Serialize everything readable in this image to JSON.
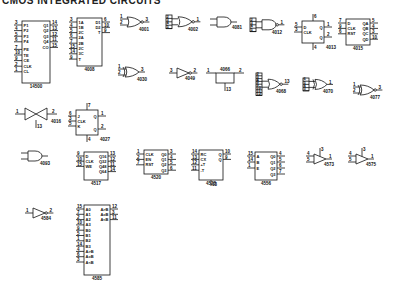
{
  "title": "CMOS INTEGRATED CIRCUITS",
  "parts": {
    "p14500": {
      "name": "14500",
      "left_pins": [
        {
          "n": "3",
          "l": "P1"
        },
        {
          "n": "4",
          "l": "P2"
        },
        {
          "n": "5",
          "l": "P3"
        },
        {
          "n": "6",
          "l": "P4"
        },
        {
          "n": "7",
          "l": "PE"
        },
        {
          "n": "10",
          "l": "TE"
        },
        {
          "n": "9",
          "l": "CE"
        },
        {
          "n": "2",
          "l": "CLK"
        },
        {
          "n": "1",
          "l": "CL"
        }
      ],
      "right_pins": [
        {
          "n": "14",
          "l": "Q1"
        },
        {
          "n": "13",
          "l": "Q2"
        },
        {
          "n": "12",
          "l": "Q3"
        },
        {
          "n": "11",
          "l": "Q4"
        },
        {
          "n": "15",
          "l": "CO"
        }
      ]
    },
    "p4008": {
      "name": "4008",
      "left_pins": [
        {
          "n": "3",
          "l": "1A"
        },
        {
          "n": "4",
          "l": "1B"
        },
        {
          "n": "5",
          "l": "2C"
        },
        {
          "n": "6",
          "l": "2A"
        },
        {
          "n": "7",
          "l": "2B"
        },
        {
          "n": "15",
          "l": "2C"
        },
        {
          "n": "14",
          "l": "3C"
        },
        {
          "n": "9",
          "l": "T"
        }
      ],
      "right_pins": [
        {
          "n": "6",
          "l": "D1"
        },
        {
          "n": "10",
          "l": "D2"
        },
        {
          "n": "9",
          "l": "T"
        }
      ]
    },
    "p4001": {
      "name": "4001",
      "in": [
        "1",
        "2"
      ],
      "out": "3"
    },
    "p4002": {
      "name": "4002",
      "in": [
        "2",
        "3",
        "4",
        "5"
      ],
      "out": "1"
    },
    "p4081": {
      "name": "4081"
    },
    "p4012": {
      "name": "4012",
      "in": [
        "2",
        "3",
        "4",
        "5"
      ],
      "out": "1"
    },
    "p4013": {
      "name": "4013",
      "pins": {
        "top": "6",
        "d": "5",
        "clk": "3",
        "q": "1",
        "qn": "2",
        "bottom": "4",
        "r": "R",
        "s": "S"
      },
      "labels": {
        "d": "D",
        "clk": "CLK",
        "q": "Q",
        "qn": "Q"
      }
    },
    "p4015": {
      "name": "4015",
      "left_pins": [
        {
          "n": "7",
          "l": "D"
        },
        {
          "n": "9",
          "l": "CLK"
        },
        {
          "n": "6",
          "l": "RST"
        }
      ],
      "right_pins": [
        {
          "n": "5",
          "l": "QA"
        },
        {
          "n": "4",
          "l": "QB"
        },
        {
          "n": "3",
          "l": "QC"
        },
        {
          "n": "10",
          "l": "QD"
        }
      ]
    },
    "p4030": {
      "name": "4030",
      "in": [
        "1",
        "2"
      ],
      "out": "3"
    },
    "p4049": {
      "name": "4049",
      "in": "3",
      "out": "2"
    },
    "p4066": {
      "name": "4066",
      "in": "1",
      "out": "2",
      "ctl": "13"
    },
    "p4068": {
      "name": "4068",
      "in": [
        "2",
        "3",
        "4",
        "5",
        "9",
        "10",
        "11",
        "12"
      ],
      "out": "13"
    },
    "p4070": {
      "name": "4070",
      "in": [
        "6",
        "5",
        "4",
        "3"
      ],
      "out": "1"
    },
    "p4077": {
      "name": "4077",
      "in": [
        "1",
        "2"
      ],
      "out": "3"
    },
    "p4016": {
      "name": "4016",
      "in": "1",
      "out": "2",
      "ctl": "13"
    },
    "p4027": {
      "name": "4027",
      "pins": {
        "top": "7",
        "j": "6",
        "clk": "3",
        "k": "5",
        "q": "1",
        "qn": "2",
        "bottom": "4"
      },
      "labels": {
        "j": "J",
        "clk": "CLK",
        "k": "K",
        "q": "Q",
        "qn": "Q",
        "s": "S",
        "r": "R"
      }
    },
    "p4093": {
      "name": "4093"
    },
    "p4517": {
      "name": "4517",
      "left_pins": [
        {
          "n": "9",
          "l": "D"
        },
        {
          "n": "10",
          "l": "CLK"
        },
        {
          "n": "15",
          "l": "WE"
        }
      ],
      "right_pins": [
        {
          "n": "13",
          "l": "Q16"
        },
        {
          "n": "12",
          "l": "Q32"
        },
        {
          "n": "11",
          "l": "Q48"
        },
        {
          "n": "14",
          "l": "Q64"
        }
      ]
    },
    "p4520": {
      "name": "4520",
      "left_pins": [
        {
          "n": "1",
          "l": "CLK"
        },
        {
          "n": "2",
          "l": "EN"
        },
        {
          "n": "7",
          "l": "RST"
        }
      ],
      "right_pins": [
        {
          "n": "3",
          "l": "Q0"
        },
        {
          "n": "4",
          "l": "Q1"
        },
        {
          "n": "5",
          "l": "Q2"
        },
        {
          "n": "6",
          "l": "Q3"
        }
      ]
    },
    "p4528": {
      "name": "4528",
      "left_pins": [
        {
          "n": "14",
          "l": "RC"
        },
        {
          "n": "13",
          "l": "CX"
        },
        {
          "n": "12",
          "l": "+T"
        },
        {
          "n": "11",
          "l": "-T"
        }
      ],
      "right_pins": [
        {
          "n": "10",
          "l": "Q"
        },
        {
          "n": "9",
          "l": "Q"
        }
      ],
      "bottom": "13"
    },
    "p4556": {
      "name": "4556",
      "left_pins": [
        {
          "n": "15",
          "l": "A"
        },
        {
          "n": "14",
          "l": "B"
        },
        {
          "n": "1",
          "l": "E"
        }
      ],
      "right_pins": [
        {
          "n": "4",
          "l": "Q0"
        },
        {
          "n": "5",
          "l": "Q1"
        },
        {
          "n": "6",
          "l": "Q2"
        },
        {
          "n": "7",
          "l": "Q3"
        }
      ]
    },
    "p4573": {
      "name": "4573",
      "in": [
        "4",
        "5"
      ],
      "out": "1",
      "top": "3"
    },
    "p4575": {
      "name": "4575",
      "in": [
        "4",
        "5"
      ],
      "out": "1",
      "top": "3"
    },
    "p4584": {
      "name": "4584",
      "in": "1",
      "out": "2"
    },
    "p4585": {
      "name": "4585",
      "left_pins": [
        {
          "n": "15",
          "l": "A0"
        },
        {
          "n": "7",
          "l": "A1"
        },
        {
          "n": "2",
          "l": "A2"
        },
        {
          "n": "10",
          "l": "A3"
        },
        {
          "n": "9",
          "l": "B0"
        },
        {
          "n": "5",
          "l": "B1"
        },
        {
          "n": "1",
          "l": "B2"
        },
        {
          "n": "14",
          "l": "B3"
        },
        {
          "n": "4",
          "l": "A>B"
        },
        {
          "n": "6",
          "l": "A=B"
        },
        {
          "n": "3",
          "l": "A<B"
        }
      ],
      "right_pins": [
        {
          "n": "12",
          "l": "A>B"
        },
        {
          "n": "3",
          "l": "A=B"
        },
        {
          "n": "11",
          "l": "A<B"
        }
      ]
    }
  }
}
